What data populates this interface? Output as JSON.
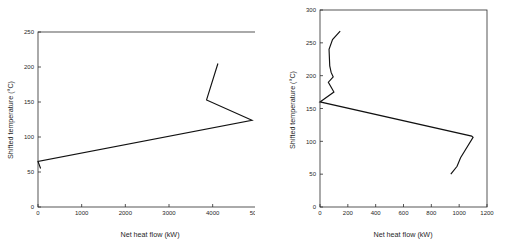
{
  "figure": {
    "background": "#ffffff",
    "line_color": "#111111",
    "axis_color": "#2b2b2b"
  },
  "chart_data": [
    {
      "id": "left",
      "type": "line",
      "title": "",
      "xlabel": "Net heat flow (kW)",
      "ylabel": "Shifted temperature (°C)",
      "xlim": [
        0,
        6000
      ],
      "ylim": [
        0,
        250
      ],
      "xticks": [
        0,
        1000,
        2000,
        3000,
        4000,
        5000,
        6000
      ],
      "xtick_labels": [
        "0",
        "1000",
        "2000",
        "3000",
        "4000",
        "5000",
        "6000"
      ],
      "yticks": [
        0,
        50,
        100,
        150,
        200,
        250
      ],
      "ytick_labels": [
        "0",
        "50",
        "100",
        "150",
        "200",
        "250"
      ],
      "grid": false,
      "legend": "none",
      "series": [
        {
          "name": "Grand composite curve",
          "x": [
            60,
            0,
            4900,
            3860,
            4120
          ],
          "y": [
            55,
            65,
            124,
            153,
            205
          ]
        }
      ]
    },
    {
      "id": "right",
      "type": "line",
      "title": "",
      "xlabel": "Net heat flow (kW)",
      "ylabel": "Shifted temperature (°C)",
      "xlim": [
        0,
        1200
      ],
      "ylim": [
        0,
        300
      ],
      "xticks": [
        0,
        200,
        400,
        600,
        800,
        1000,
        1200
      ],
      "xtick_labels": [
        "0",
        "200",
        "400",
        "600",
        "800",
        "1000",
        "1200"
      ],
      "yticks": [
        0,
        50,
        100,
        150,
        200,
        250,
        300
      ],
      "ytick_labels": [
        "0",
        "50",
        "100",
        "150",
        "200",
        "250",
        "300"
      ],
      "grid": false,
      "legend": "none",
      "series": [
        {
          "name": "Grand composite curve",
          "x": [
            940,
            985,
            1010,
            1100,
            1090,
            0,
            100,
            60,
            95,
            80,
            70,
            65,
            90,
            145
          ],
          "y": [
            50,
            62,
            75,
            106,
            108,
            160,
            175,
            190,
            198,
            205,
            215,
            240,
            255,
            268
          ]
        }
      ]
    }
  ]
}
